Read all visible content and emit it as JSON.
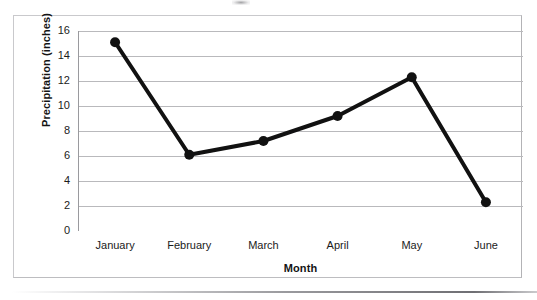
{
  "chart_data": {
    "type": "line",
    "title": "",
    "xlabel": "Month",
    "ylabel": "Precipitation (inches)",
    "categories": [
      "January",
      "February",
      "March",
      "April",
      "May",
      "June"
    ],
    "values": [
      15.1,
      6.1,
      7.2,
      9.2,
      12.3,
      2.3
    ],
    "series": [
      {
        "name": "Precipitation",
        "values": [
          15.1,
          6.1,
          7.2,
          9.2,
          12.3,
          2.3
        ]
      }
    ],
    "ylim": [
      0,
      16
    ],
    "ytick_values": [
      0,
      2,
      4,
      6,
      8,
      10,
      12,
      14,
      16
    ],
    "ytick_labels": [
      "0",
      "2",
      "4",
      "6",
      "8",
      "10",
      "12",
      "14",
      "16"
    ],
    "grid": "horizontal",
    "legend": "none",
    "marker": "filled-circle",
    "line_color": "#111111",
    "marker_color": "#111111",
    "gridline_color": "#b9b9bc",
    "axis_color": "#9a9a9e",
    "frame_color": "#c9c9cc"
  },
  "axes": {
    "y_title": "Precipitation (inches)",
    "x_title": "Month"
  }
}
